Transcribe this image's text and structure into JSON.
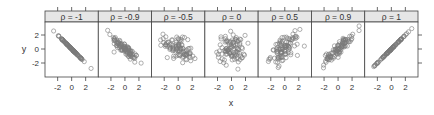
{
  "chart_data": {
    "type": "scatter",
    "layout": "trellis 7x1 panels",
    "title": "",
    "xlabel": "x",
    "ylabel": "y",
    "xlim": [
      -3.6,
      3.6
    ],
    "ylim": [
      -4.0,
      4.0
    ],
    "x_ticks": [
      -2,
      0,
      2
    ],
    "y_ticks": [
      -2,
      0,
      2
    ],
    "x_tick_labels": [
      "-2",
      "0",
      "2"
    ],
    "y_tick_labels": [
      "2",
      "0",
      "-2"
    ],
    "grid": false,
    "legend": null,
    "marker": "open-circle",
    "marker_color": "#7a7a7a",
    "strip_color": "#e6e6e6",
    "n_points_per_panel": 100,
    "panels": [
      {
        "label": "ρ = -1",
        "rho": -1.0
      },
      {
        "label": "ρ = -0.9",
        "rho": -0.9
      },
      {
        "label": "ρ = -0.5",
        "rho": -0.5
      },
      {
        "label": "ρ = 0",
        "rho": 0.0
      },
      {
        "label": "ρ = 0.5",
        "rho": 0.5
      },
      {
        "label": "ρ = 0.9",
        "rho": 0.9
      },
      {
        "label": "ρ = 1",
        "rho": 1.0
      }
    ]
  }
}
